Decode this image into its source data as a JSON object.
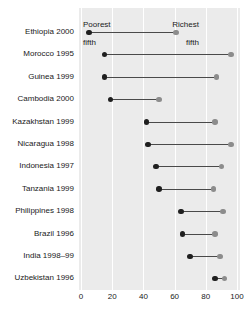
{
  "chart_data": {
    "type": "scatter",
    "subtype": "dumbbell",
    "title": "",
    "subtitle": "",
    "xlabel": "",
    "ylabel": "",
    "xlim": [
      0,
      100
    ],
    "xticks": [
      0,
      20,
      40,
      60,
      80,
      100
    ],
    "xtick_labels": [
      "0",
      "20",
      "40",
      "60",
      "80",
      "100"
    ],
    "grid": true,
    "grid_axis": "x",
    "legend_position": "top-inside-panel",
    "annotations": [
      {
        "name": "poorest-fifth-note",
        "text": "Poorest\nfifth",
        "line1": "Poorest",
        "line2": "fifth"
      },
      {
        "name": "richest-fifth-note",
        "text": "Richest\nfifth",
        "line1": "Richest",
        "line2": "fifth"
      }
    ],
    "series": [
      {
        "name": "Poorest fifth",
        "color": "#1f1f1f",
        "values": [
          5,
          15,
          15,
          19,
          42,
          43,
          48,
          50,
          64,
          65,
          70,
          86
        ]
      },
      {
        "name": "Richest fifth",
        "color": "#8c8c8c",
        "values": [
          61,
          96,
          87,
          50,
          86,
          96,
          90,
          85,
          91,
          86,
          89,
          92
        ]
      }
    ],
    "categories": [
      "Ethiopia 2000",
      "Morocco 1995",
      "Guinea 1999",
      "Cambodia 2000",
      "Kazakhstan 1999",
      "Nicaragua 1998",
      "Indonesia 1997",
      "Tanzania 1999",
      "Philippines 1998",
      "Brazil 1996",
      "India 1998–99",
      "Uzbekistan 1996"
    ],
    "rows": [
      {
        "label": "Ethiopia 2000",
        "poorest": 5,
        "richest": 61
      },
      {
        "label": "Morocco 1995",
        "poorest": 15,
        "richest": 96
      },
      {
        "label": "Guinea 1999",
        "poorest": 15,
        "richest": 87
      },
      {
        "label": "Cambodia 2000",
        "poorest": 19,
        "richest": 50
      },
      {
        "label": "Kazakhstan 1999",
        "poorest": 42,
        "richest": 86
      },
      {
        "label": "Nicaragua 1998",
        "poorest": 43,
        "richest": 96
      },
      {
        "label": "Indonesia 1997",
        "poorest": 48,
        "richest": 90
      },
      {
        "label": "Tanzania 1999",
        "poorest": 50,
        "richest": 85
      },
      {
        "label": "Philippines 1998",
        "poorest": 64,
        "richest": 91
      },
      {
        "label": "Brazil 1996",
        "poorest": 65,
        "richest": 86
      },
      {
        "label": "India 1998–99",
        "poorest": 70,
        "richest": 89
      },
      {
        "label": "Uzbekistan 1996",
        "poorest": 86,
        "richest": 92
      }
    ],
    "colors": {
      "panel_background": "#ebebeb",
      "page_background": "#ffffff",
      "gridline": "#ffffff",
      "connector": "#4a4a4a",
      "poorest_dot": "#1f1f1f",
      "richest_dot": "#8c8c8c",
      "text": "#1a1a1a"
    }
  }
}
